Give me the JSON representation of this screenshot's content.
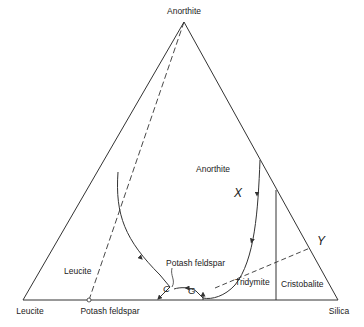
{
  "diagram": {
    "type": "ternary-phase-diagram",
    "vertices": {
      "top": "Anorthite",
      "bottom_left": "Leucite",
      "bottom_right": "Silica"
    },
    "base_compound": "Potash feldspar",
    "fields": {
      "anorthite": "Anorthite",
      "leucite": "Leucite",
      "potash_feldspar": "Potash feldspar",
      "tridymite": "Tridymite",
      "cristobalite": "Cristobalite"
    },
    "points": {
      "x": "X",
      "y": "Y",
      "c": "C",
      "g": "G"
    },
    "colors": {
      "line": "#333333",
      "text": "#222222",
      "background": "#ffffff"
    }
  }
}
